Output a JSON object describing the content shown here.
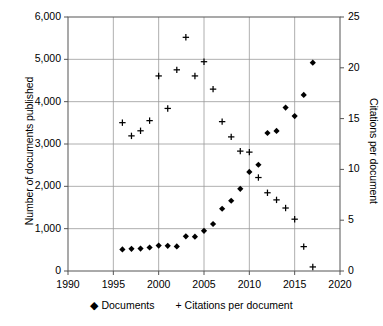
{
  "chart_data": {
    "type": "scatter",
    "title": "",
    "xlabel": "",
    "ylabel": "Number of documents published",
    "y2label": "Citations per document",
    "xlim": [
      1990,
      2020
    ],
    "ylim": [
      0,
      6000
    ],
    "y2lim": [
      0,
      25
    ],
    "grid": true,
    "legend_position": "bottom",
    "x_ticks": [
      "1990",
      "1995",
      "2000",
      "2005",
      "2010",
      "2015",
      "2020"
    ],
    "x_tick_values": [
      1990,
      1995,
      2000,
      2005,
      2010,
      2015,
      2020
    ],
    "y_ticks": [
      "0",
      "1,000",
      "2,000",
      "3,000",
      "4,000",
      "5,000",
      "6,000"
    ],
    "y_tick_values": [
      0,
      1000,
      2000,
      3000,
      4000,
      5000,
      6000
    ],
    "y2_ticks": [
      "0",
      "5",
      "10",
      "15",
      "20",
      "25"
    ],
    "y2_tick_values": [
      0,
      5,
      10,
      15,
      20,
      25
    ],
    "series": [
      {
        "name": "Documents",
        "marker": "diamond",
        "axis": "left",
        "color": "#000000",
        "x": [
          1996,
          1997,
          1998,
          1999,
          2000,
          2001,
          2002,
          2003,
          2004,
          2005,
          2006,
          2007,
          2008,
          2009,
          2010,
          2011,
          2012,
          2013,
          2014,
          2015,
          2016,
          2017
        ],
        "values": [
          510,
          525,
          530,
          555,
          600,
          595,
          580,
          820,
          810,
          950,
          1110,
          1470,
          1660,
          1940,
          2340,
          2510,
          3260,
          3310,
          3860,
          3660,
          4160,
          4920
        ]
      },
      {
        "name": "Citations per document",
        "marker": "plus",
        "axis": "right",
        "color": "#000000",
        "x": [
          1996,
          1997,
          1998,
          1999,
          2000,
          2001,
          2002,
          2003,
          2004,
          2005,
          2006,
          2007,
          2008,
          2009,
          2010,
          2011,
          2012,
          2013,
          2014,
          2015,
          2016,
          2017
        ],
        "values": [
          14.6,
          13.3,
          13.8,
          14.8,
          19.2,
          16.0,
          19.8,
          23.0,
          19.2,
          20.6,
          17.9,
          14.7,
          13.2,
          11.8,
          11.7,
          9.2,
          7.7,
          7.0,
          6.2,
          5.1,
          2.4,
          0.4
        ]
      }
    ]
  },
  "legend": {
    "entries": [
      {
        "label": "Documents",
        "marker": "diamond-marker"
      },
      {
        "label": "Citations per document",
        "marker": "plus-marker"
      }
    ]
  }
}
